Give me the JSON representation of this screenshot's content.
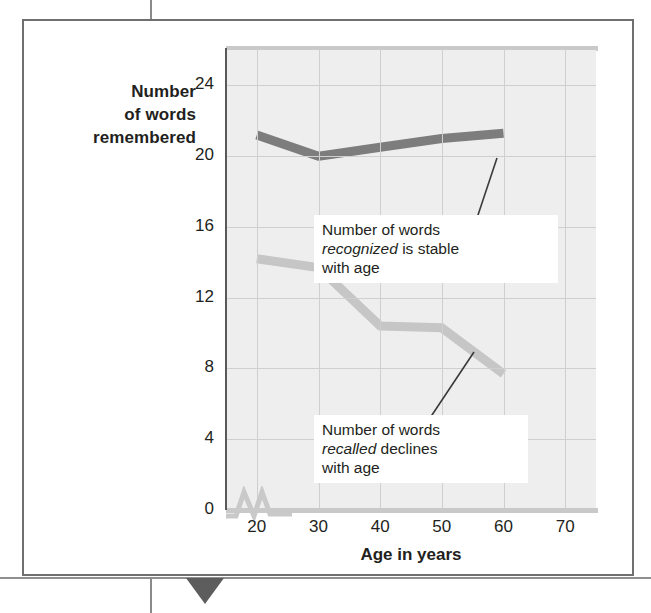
{
  "figure": {
    "y_axis_caption": [
      "Number",
      "of words",
      "remembered"
    ],
    "x_axis_label": "Age in years"
  },
  "callouts": [
    {
      "id": "recognized",
      "line1_pre": "Number of words",
      "line2_italic": "recognized",
      "line2_rest": " is stable",
      "line3": "with age"
    },
    {
      "id": "recalled",
      "line1_pre": "Number of words",
      "line2_italic": "recalled",
      "line2_rest": " declines",
      "line3": "with age"
    }
  ],
  "colors": {
    "recognized_line": "#7d7d7d",
    "recalled_line": "#c6c6c6",
    "plot_background": "#eeeeee",
    "gridline": "#cfcfcf",
    "axis": "#595959",
    "frame": "#6f6f6f",
    "text": "#231f20"
  },
  "chart_data": {
    "type": "line",
    "title": "",
    "xlabel": "Age in years",
    "ylabel": "Number of words remembered",
    "x": [
      20,
      30,
      40,
      50,
      60
    ],
    "xlim": [
      15,
      75
    ],
    "ylim": [
      0,
      26
    ],
    "xticks": [
      20,
      30,
      40,
      50,
      60,
      70
    ],
    "yticks": [
      0,
      4,
      8,
      12,
      16,
      20,
      24
    ],
    "grid": true,
    "legend": "none",
    "axis_break": "y-axis break between 0 and 4 near origin",
    "series": [
      {
        "name": "Number of words recognized",
        "color": "#7d7d7d",
        "values": [
          21.2,
          20.0,
          20.5,
          21.0,
          21.3
        ]
      },
      {
        "name": "Number of words recalled",
        "color": "#c6c6c6",
        "values": [
          14.2,
          13.7,
          10.4,
          10.3,
          7.7
        ]
      }
    ],
    "annotations": [
      "Number of words recognized is stable with age",
      "Number of words recalled declines with age"
    ]
  }
}
